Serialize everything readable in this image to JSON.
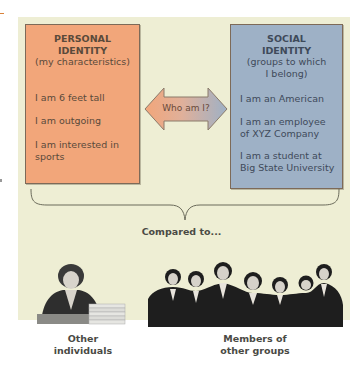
{
  "personal_identity": {
    "title_line1": "PERSONAL",
    "title_line2": "IDENTITY",
    "subtitle": "(my characteristics)",
    "items": [
      {
        "line1": "I am 6 feet tall",
        "line2": ""
      },
      {
        "line1": "I am outgoing",
        "line2": ""
      },
      {
        "line1": "I am interested in",
        "line2": "sports"
      }
    ],
    "color": "#f2a67a"
  },
  "social_identity": {
    "title_line1": "SOCIAL",
    "title_line2": "IDENTITY",
    "subtitle_line1": "(groups to which",
    "subtitle_line2": "I belong)",
    "items": [
      {
        "line1": "I am an American",
        "line2": ""
      },
      {
        "line1": "I am an employee",
        "line2": "of XYZ Company"
      },
      {
        "line1": "I am a student at",
        "line2": "Big State University"
      }
    ],
    "color": "#9eb1c6"
  },
  "center_arrow": {
    "label": "Who am I?",
    "icon": "double-headed-arrow-icon"
  },
  "comparison": {
    "label": "Compared to..."
  },
  "comparison_targets": [
    {
      "icon": "woman-at-desk-photo",
      "caption_line1": "Other",
      "caption_line2": "individuals"
    },
    {
      "icon": "group-of-men-photo",
      "caption_line1": "Members of",
      "caption_line2": "other groups"
    }
  ],
  "colors": {
    "panel_background": "#eeeed4",
    "personal_box": "#f2a67a",
    "social_box": "#9eb1c6",
    "border": "#7d6a58"
  }
}
